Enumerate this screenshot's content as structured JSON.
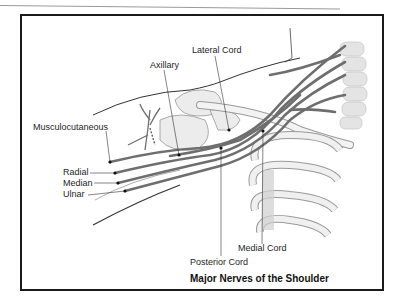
{
  "diagram": {
    "title": "Major Nerves of the Shoulder",
    "labels": {
      "lateral_cord": "Lateral Cord",
      "axillary": "Axillary",
      "musculocutaneous": "Musculocutaneous",
      "radial": "Radial",
      "median": "Median",
      "ulnar": "Ulnar",
      "posterior_cord": "Posterior Cord",
      "medial_cord": "Medial Cord"
    },
    "colors": {
      "nerve": "#6e6e6e",
      "bone": "#e8e8e8",
      "outline": "#4a4a4a",
      "frame": "#1a1a1a"
    }
  }
}
